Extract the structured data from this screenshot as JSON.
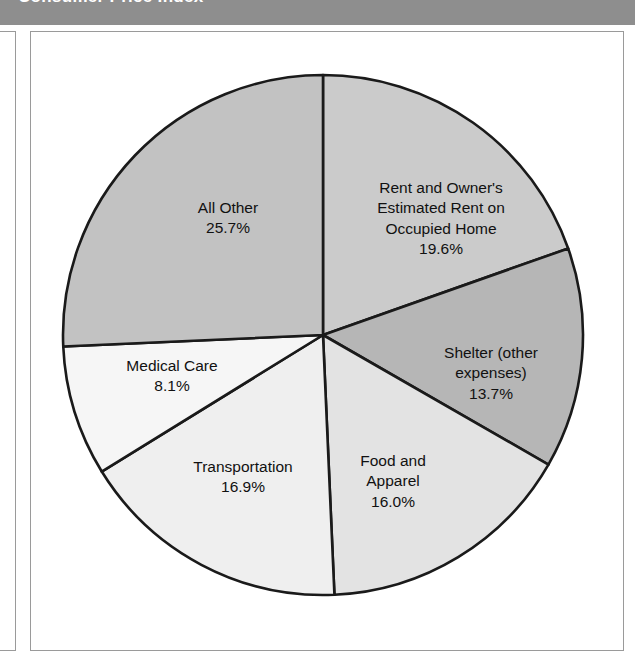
{
  "header": {
    "title": "Consumer Price Index",
    "band_color": "#8e8e8e",
    "text_color": "#ffffff"
  },
  "figure": {
    "frame_color": "#9a9a9a",
    "background": "#ffffff"
  },
  "chart_data": {
    "type": "pie",
    "title": "",
    "subtitle": "",
    "xlabel": "",
    "ylabel": "",
    "legend_position": "none",
    "grid": false,
    "start_angle_deg": 0,
    "direction": "clockwise",
    "units": "percent",
    "total": 100.0,
    "categories": [
      "Rent and Owner's Estimated Rent on Occupied Home",
      "Shelter (other expenses)",
      "Food and Apparel",
      "Transportation",
      "Medical Care",
      "All Other"
    ],
    "values": [
      19.6,
      13.7,
      16.0,
      16.9,
      8.1,
      25.7
    ],
    "slices": [
      {
        "id": "rent",
        "label_lines": [
          "Rent and Owner's",
          "Estimated Rent on",
          "Occupied Home"
        ],
        "value_text": "19.6%",
        "value": 19.6,
        "color": "#cbcbcb",
        "start_deg": 0.0,
        "end_deg": 70.56,
        "label_x": 410,
        "label_y": 187
      },
      {
        "id": "shelter",
        "label_lines": [
          "Shelter (other",
          "expenses)"
        ],
        "value_text": "13.7%",
        "value": 13.7,
        "color": "#b6b6b6",
        "start_deg": 70.56,
        "end_deg": 119.88,
        "label_x": 460,
        "label_y": 342
      },
      {
        "id": "food-apparel",
        "label_lines": [
          "Food and",
          "Apparel"
        ],
        "value_text": "16.0%",
        "value": 16.0,
        "color": "#e3e3e3",
        "start_deg": 119.88,
        "end_deg": 177.48,
        "label_x": 362,
        "label_y": 450
      },
      {
        "id": "transportation",
        "label_lines": [
          "Transportation"
        ],
        "value_text": "16.9%",
        "value": 16.9,
        "color": "#efefef",
        "start_deg": 177.48,
        "end_deg": 238.32,
        "label_x": 212,
        "label_y": 445
      },
      {
        "id": "medical-care",
        "label_lines": [
          "Medical Care"
        ],
        "value_text": "8.1%",
        "value": 8.1,
        "color": "#f6f6f6",
        "start_deg": 238.32,
        "end_deg": 267.48,
        "label_x": 141,
        "label_y": 344
      },
      {
        "id": "all-other",
        "label_lines": [
          "All Other"
        ],
        "value_text": "25.7%",
        "value": 25.7,
        "color": "#c2c2c2",
        "start_deg": 267.48,
        "end_deg": 360.0,
        "label_x": 197,
        "label_y": 186
      }
    ],
    "geometry": {
      "center_x": 292,
      "center_y": 303,
      "radius": 260,
      "outline_color": "#1a1a1a",
      "outline_width": 2.6
    }
  }
}
